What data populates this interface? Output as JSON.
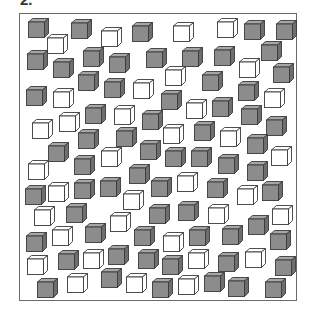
{
  "figure": {
    "label": "2.",
    "colors": {
      "gray_front": "#8c8c8c",
      "gray_top": "#a6a6a6",
      "gray_side": "#6e6e6e",
      "white": "#ffffff",
      "outline": "#3a3a3a",
      "frame": "#6a6a6a"
    },
    "cube_counts": {
      "gray": 78,
      "white": 36
    },
    "cubes": [
      {
        "x": 28,
        "y": 18,
        "c": "gray"
      },
      {
        "x": 47,
        "y": 34,
        "c": "white"
      },
      {
        "x": 71,
        "y": 19,
        "c": "gray"
      },
      {
        "x": 101,
        "y": 27,
        "c": "white"
      },
      {
        "x": 132,
        "y": 22,
        "c": "gray"
      },
      {
        "x": 173,
        "y": 22,
        "c": "white"
      },
      {
        "x": 217,
        "y": 18,
        "c": "white"
      },
      {
        "x": 244,
        "y": 20,
        "c": "gray"
      },
      {
        "x": 276,
        "y": 20,
        "c": "gray"
      },
      {
        "x": 27,
        "y": 50,
        "c": "gray"
      },
      {
        "x": 53,
        "y": 58,
        "c": "gray"
      },
      {
        "x": 83,
        "y": 47,
        "c": "gray"
      },
      {
        "x": 109,
        "y": 53,
        "c": "gray"
      },
      {
        "x": 146,
        "y": 48,
        "c": "gray"
      },
      {
        "x": 182,
        "y": 47,
        "c": "gray"
      },
      {
        "x": 214,
        "y": 46,
        "c": "gray"
      },
      {
        "x": 261,
        "y": 41,
        "c": "gray"
      },
      {
        "x": 239,
        "y": 58,
        "c": "white"
      },
      {
        "x": 273,
        "y": 63,
        "c": "gray"
      },
      {
        "x": 165,
        "y": 66,
        "c": "white"
      },
      {
        "x": 202,
        "y": 71,
        "c": "gray"
      },
      {
        "x": 78,
        "y": 71,
        "c": "gray"
      },
      {
        "x": 104,
        "y": 78,
        "c": "gray"
      },
      {
        "x": 133,
        "y": 79,
        "c": "white"
      },
      {
        "x": 26,
        "y": 86,
        "c": "gray"
      },
      {
        "x": 53,
        "y": 88,
        "c": "white"
      },
      {
        "x": 161,
        "y": 90,
        "c": "gray"
      },
      {
        "x": 238,
        "y": 81,
        "c": "gray"
      },
      {
        "x": 264,
        "y": 88,
        "c": "white"
      },
      {
        "x": 186,
        "y": 99,
        "c": "white"
      },
      {
        "x": 212,
        "y": 97,
        "c": "gray"
      },
      {
        "x": 85,
        "y": 104,
        "c": "gray"
      },
      {
        "x": 114,
        "y": 105,
        "c": "white"
      },
      {
        "x": 142,
        "y": 110,
        "c": "gray"
      },
      {
        "x": 241,
        "y": 105,
        "c": "gray"
      },
      {
        "x": 32,
        "y": 119,
        "c": "white"
      },
      {
        "x": 59,
        "y": 112,
        "c": "white"
      },
      {
        "x": 266,
        "y": 116,
        "c": "gray"
      },
      {
        "x": 163,
        "y": 124,
        "c": "white"
      },
      {
        "x": 194,
        "y": 121,
        "c": "gray"
      },
      {
        "x": 220,
        "y": 127,
        "c": "white"
      },
      {
        "x": 78,
        "y": 129,
        "c": "gray"
      },
      {
        "x": 116,
        "y": 127,
        "c": "gray"
      },
      {
        "x": 247,
        "y": 134,
        "c": "gray"
      },
      {
        "x": 48,
        "y": 142,
        "c": "gray"
      },
      {
        "x": 140,
        "y": 140,
        "c": "gray"
      },
      {
        "x": 101,
        "y": 147,
        "c": "white"
      },
      {
        "x": 74,
        "y": 155,
        "c": "gray"
      },
      {
        "x": 165,
        "y": 147,
        "c": "gray"
      },
      {
        "x": 191,
        "y": 147,
        "c": "gray"
      },
      {
        "x": 218,
        "y": 154,
        "c": "gray"
      },
      {
        "x": 271,
        "y": 146,
        "c": "white"
      },
      {
        "x": 28,
        "y": 160,
        "c": "white"
      },
      {
        "x": 247,
        "y": 161,
        "c": "gray"
      },
      {
        "x": 129,
        "y": 164,
        "c": "gray"
      },
      {
        "x": 177,
        "y": 172,
        "c": "white"
      },
      {
        "x": 25,
        "y": 185,
        "c": "gray"
      },
      {
        "x": 48,
        "y": 182,
        "c": "white"
      },
      {
        "x": 74,
        "y": 179,
        "c": "gray"
      },
      {
        "x": 100,
        "y": 177,
        "c": "gray"
      },
      {
        "x": 151,
        "y": 177,
        "c": "gray"
      },
      {
        "x": 207,
        "y": 178,
        "c": "gray"
      },
      {
        "x": 237,
        "y": 185,
        "c": "white"
      },
      {
        "x": 262,
        "y": 181,
        "c": "gray"
      },
      {
        "x": 123,
        "y": 190,
        "c": "white"
      },
      {
        "x": 34,
        "y": 206,
        "c": "white"
      },
      {
        "x": 66,
        "y": 203,
        "c": "gray"
      },
      {
        "x": 110,
        "y": 212,
        "c": "white"
      },
      {
        "x": 149,
        "y": 204,
        "c": "gray"
      },
      {
        "x": 178,
        "y": 201,
        "c": "gray"
      },
      {
        "x": 208,
        "y": 204,
        "c": "white"
      },
      {
        "x": 248,
        "y": 215,
        "c": "gray"
      },
      {
        "x": 272,
        "y": 205,
        "c": "white"
      },
      {
        "x": 26,
        "y": 232,
        "c": "gray"
      },
      {
        "x": 52,
        "y": 226,
        "c": "white"
      },
      {
        "x": 85,
        "y": 223,
        "c": "gray"
      },
      {
        "x": 134,
        "y": 226,
        "c": "gray"
      },
      {
        "x": 163,
        "y": 232,
        "c": "white"
      },
      {
        "x": 189,
        "y": 226,
        "c": "gray"
      },
      {
        "x": 222,
        "y": 225,
        "c": "gray"
      },
      {
        "x": 270,
        "y": 230,
        "c": "gray"
      },
      {
        "x": 27,
        "y": 255,
        "c": "white"
      },
      {
        "x": 58,
        "y": 250,
        "c": "gray"
      },
      {
        "x": 83,
        "y": 249,
        "c": "white"
      },
      {
        "x": 108,
        "y": 245,
        "c": "gray"
      },
      {
        "x": 138,
        "y": 249,
        "c": "gray"
      },
      {
        "x": 162,
        "y": 255,
        "c": "gray"
      },
      {
        "x": 188,
        "y": 249,
        "c": "white"
      },
      {
        "x": 218,
        "y": 252,
        "c": "gray"
      },
      {
        "x": 245,
        "y": 248,
        "c": "white"
      },
      {
        "x": 275,
        "y": 256,
        "c": "gray"
      },
      {
        "x": 37,
        "y": 278,
        "c": "gray"
      },
      {
        "x": 67,
        "y": 273,
        "c": "white"
      },
      {
        "x": 101,
        "y": 268,
        "c": "gray"
      },
      {
        "x": 126,
        "y": 273,
        "c": "white"
      },
      {
        "x": 152,
        "y": 278,
        "c": "gray"
      },
      {
        "x": 178,
        "y": 275,
        "c": "white"
      },
      {
        "x": 204,
        "y": 272,
        "c": "gray"
      },
      {
        "x": 228,
        "y": 277,
        "c": "gray"
      },
      {
        "x": 265,
        "y": 278,
        "c": "gray"
      }
    ]
  }
}
